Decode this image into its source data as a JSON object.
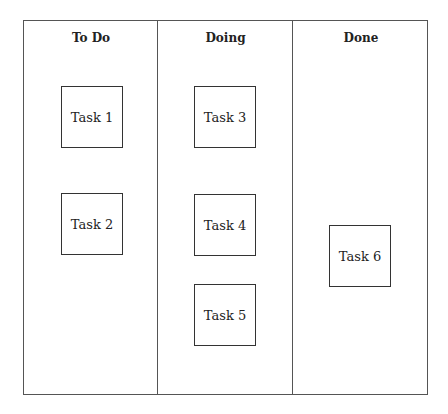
{
  "board": {
    "columns": [
      {
        "title": "To Do",
        "left": 0,
        "width": 134
      },
      {
        "title": "Doing",
        "left": 134,
        "width": 135
      },
      {
        "title": "Done",
        "left": 269,
        "width": 136
      }
    ],
    "cards": [
      {
        "label": "Task 1",
        "column": "To Do",
        "x": 37,
        "y": 65
      },
      {
        "label": "Task 2",
        "column": "To Do",
        "x": 37,
        "y": 172
      },
      {
        "label": "Task 3",
        "column": "Doing",
        "x": 170,
        "y": 65
      },
      {
        "label": "Task 4",
        "column": "Doing",
        "x": 170,
        "y": 173
      },
      {
        "label": "Task 5",
        "column": "Doing",
        "x": 170,
        "y": 263
      },
      {
        "label": "Task 6",
        "column": "Done",
        "x": 305,
        "y": 204
      }
    ]
  }
}
